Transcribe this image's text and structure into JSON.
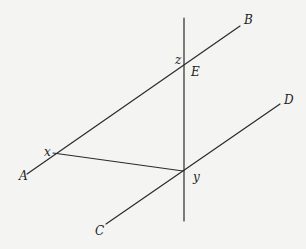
{
  "diagram": {
    "type": "geometry",
    "line_color": "#2a2a2a",
    "background": "#f4f4f2",
    "lines": [
      {
        "id": "AB",
        "x1": 27,
        "y1": 174,
        "x2": 240,
        "y2": 26
      },
      {
        "id": "CD",
        "x1": 106,
        "y1": 224,
        "x2": 280,
        "y2": 104
      },
      {
        "id": "transversal",
        "x1": 184,
        "y1": 18,
        "x2": 184,
        "y2": 221
      },
      {
        "id": "xy",
        "x1": 53,
        "y1": 153,
        "x2": 183,
        "y2": 171
      }
    ],
    "labels": {
      "B": {
        "text": "B",
        "x": 244,
        "y": 24
      },
      "z": {
        "text": "z",
        "x": 175,
        "y": 64
      },
      "E": {
        "text": "E",
        "x": 191,
        "y": 76
      },
      "D": {
        "text": "D",
        "x": 284,
        "y": 104
      },
      "x": {
        "text": "x",
        "x": 44,
        "y": 156
      },
      "A": {
        "text": "A",
        "x": 19,
        "y": 180
      },
      "y": {
        "text": "y",
        "x": 193,
        "y": 181
      },
      "C": {
        "text": "C",
        "x": 95,
        "y": 235
      }
    }
  }
}
